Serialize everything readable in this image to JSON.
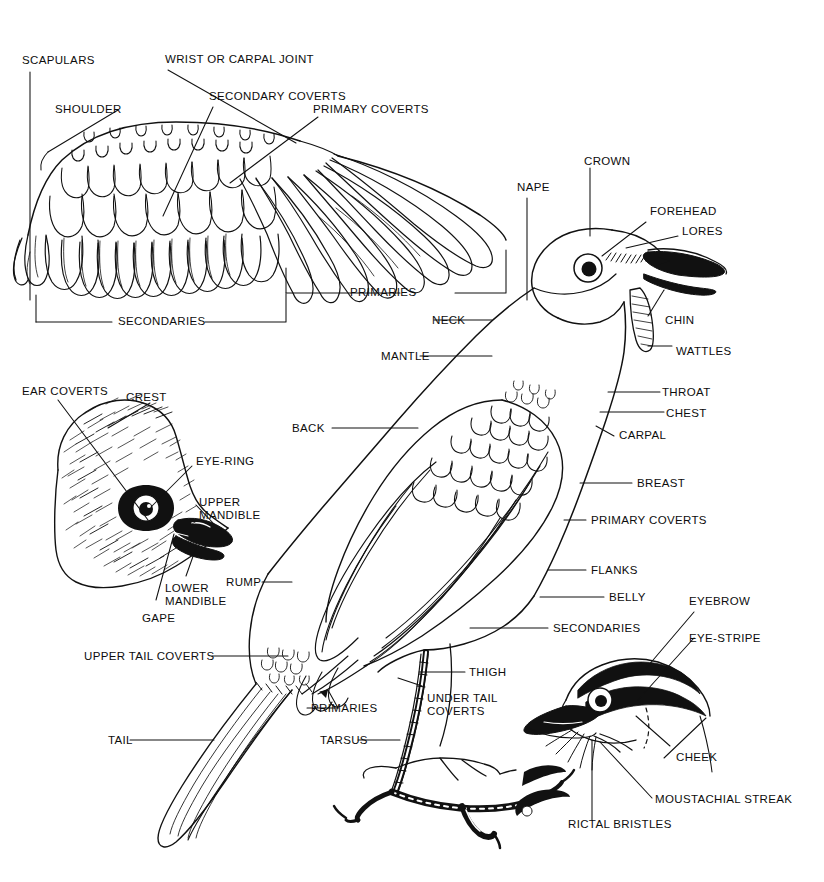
{
  "diagram": {
    "style": "black-and-white line engraving",
    "ink_color": "#111111",
    "background_color": "#ffffff"
  },
  "panels": [
    {
      "id": "wing",
      "name": "Spread wing (upper left)"
    },
    {
      "id": "crested-head",
      "name": "Crested head detail (middle left)"
    },
    {
      "id": "body",
      "name": "Whole bird, perched (center right)"
    },
    {
      "id": "face-pattern",
      "name": "Face pattern head detail (lower right)"
    }
  ],
  "labels": {
    "wing": [
      {
        "key": "scapulars",
        "text": "SCAPULARS"
      },
      {
        "key": "wrist_or_carpal_joint",
        "text": "WRIST OR CARPAL JOINT"
      },
      {
        "key": "shoulder",
        "text": "SHOULDER"
      },
      {
        "key": "secondary_coverts",
        "text": "SECONDARY COVERTS"
      },
      {
        "key": "primary_coverts",
        "text": "PRIMARY COVERTS"
      },
      {
        "key": "primaries",
        "text": "PRIMARIES"
      },
      {
        "key": "secondaries",
        "text": "SECONDARIES"
      }
    ],
    "crested_head": [
      {
        "key": "ear_coverts",
        "text": "EAR COVERTS"
      },
      {
        "key": "crest",
        "text": "CREST"
      },
      {
        "key": "eye_ring",
        "text": "EYE-RING"
      },
      {
        "key": "upper_mandible_1",
        "text": "UPPER"
      },
      {
        "key": "upper_mandible_2",
        "text": "MANDIBLE"
      },
      {
        "key": "lower_mandible_1",
        "text": "LOWER"
      },
      {
        "key": "lower_mandible_2",
        "text": "MANDIBLE"
      },
      {
        "key": "gape",
        "text": "GAPE"
      }
    ],
    "body_left": [
      {
        "key": "back",
        "text": "BACK"
      },
      {
        "key": "rump",
        "text": "RUMP"
      },
      {
        "key": "upper_tail_coverts",
        "text": "UPPER TAIL COVERTS"
      },
      {
        "key": "tail",
        "text": "TAIL"
      },
      {
        "key": "primaries_body",
        "text": "PRIMARIES"
      },
      {
        "key": "tarsus",
        "text": "TARSUS"
      },
      {
        "key": "mantle",
        "text": "MANTLE"
      },
      {
        "key": "neck",
        "text": "NECK"
      },
      {
        "key": "nape",
        "text": "NAPE"
      },
      {
        "key": "thigh",
        "text": "THIGH"
      },
      {
        "key": "under_tail_coverts_1",
        "text": "UNDER TAIL"
      },
      {
        "key": "under_tail_coverts_2",
        "text": "COVERTS"
      }
    ],
    "body_right": [
      {
        "key": "crown",
        "text": "CROWN"
      },
      {
        "key": "forehead",
        "text": "FOREHEAD"
      },
      {
        "key": "lores",
        "text": "LORES"
      },
      {
        "key": "chin",
        "text": "CHIN"
      },
      {
        "key": "wattles",
        "text": "WATTLES"
      },
      {
        "key": "throat",
        "text": "THROAT"
      },
      {
        "key": "chest",
        "text": "CHEST"
      },
      {
        "key": "carpal",
        "text": "CARPAL"
      },
      {
        "key": "breast",
        "text": "BREAST"
      },
      {
        "key": "primary_coverts_body",
        "text": "PRIMARY COVERTS"
      },
      {
        "key": "flanks",
        "text": "FLANKS"
      },
      {
        "key": "belly",
        "text": "BELLY"
      },
      {
        "key": "secondaries_body",
        "text": "SECONDARIES"
      }
    ],
    "face_pattern": [
      {
        "key": "eyebrow",
        "text": "EYEBROW"
      },
      {
        "key": "eye_stripe",
        "text": "EYE-STRIPE"
      },
      {
        "key": "cheek",
        "text": "CHEEK"
      },
      {
        "key": "moustachial_streak",
        "text": "MOUSTACHIAL STREAK"
      },
      {
        "key": "rictal_bristles",
        "text": "RICTAL BRISTLES"
      }
    ]
  }
}
